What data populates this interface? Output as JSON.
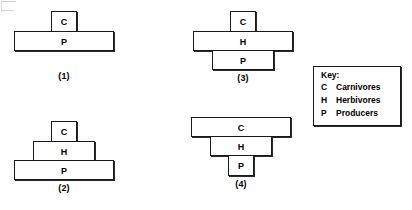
{
  "diagram": {
    "title_visible": false,
    "background_color": "#fefefe",
    "line_color": "#1a1a1a",
    "figures": [
      {
        "id": "figure-1",
        "label": "(1)",
        "levels": [
          {
            "symbol": "C",
            "width": 26,
            "height": 21,
            "level_index": 0
          },
          {
            "symbol": "P",
            "width": 100,
            "height": 20,
            "level_index": 1
          }
        ]
      },
      {
        "id": "figure-2",
        "label": "(2)",
        "levels": [
          {
            "symbol": "C",
            "width": 26,
            "height": 21,
            "level_index": 0
          },
          {
            "symbol": "H",
            "width": 62,
            "height": 20,
            "level_index": 1
          },
          {
            "symbol": "P",
            "width": 100,
            "height": 20,
            "level_index": 2
          }
        ]
      },
      {
        "id": "figure-3",
        "label": "(3)",
        "levels": [
          {
            "symbol": "C",
            "width": 26,
            "height": 21,
            "level_index": 0
          },
          {
            "symbol": "H",
            "width": 100,
            "height": 20,
            "level_index": 1
          },
          {
            "symbol": "P",
            "width": 62,
            "height": 20,
            "level_index": 2
          }
        ]
      },
      {
        "id": "figure-4",
        "label": "(4)",
        "levels": [
          {
            "symbol": "C",
            "width": 100,
            "height": 20,
            "level_index": 0
          },
          {
            "symbol": "H",
            "width": 62,
            "height": 20,
            "level_index": 1
          },
          {
            "symbol": "P",
            "width": 26,
            "height": 21,
            "level_index": 2
          }
        ]
      }
    ]
  },
  "key": {
    "title": "Key:",
    "entries": [
      {
        "symbol": "C",
        "name": "Carnivores"
      },
      {
        "symbol": "H",
        "name": "Herbivores"
      },
      {
        "symbol": "P",
        "name": "Producers"
      }
    ]
  }
}
